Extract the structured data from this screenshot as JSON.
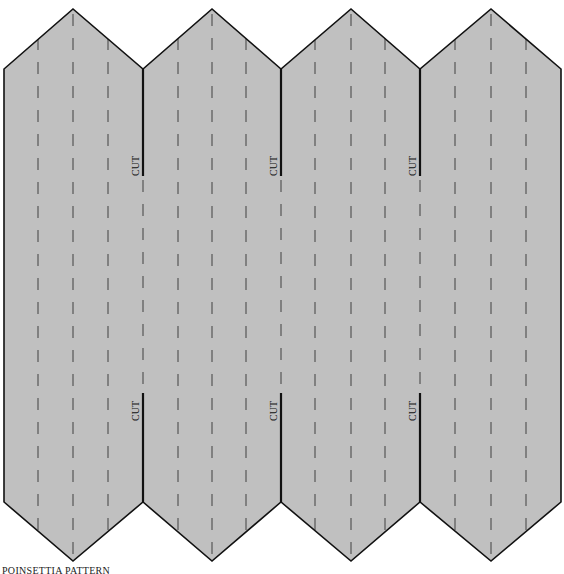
{
  "title": "POINSETTIA PATTERN",
  "colors": {
    "fill": "#c0c0c0",
    "outline": "#111111",
    "fold_line": "#555555",
    "background": "#ffffff"
  },
  "pattern": {
    "panel_count": 4,
    "panel_edges_x": [
      4,
      143,
      281,
      420,
      561
    ],
    "peak_x": [
      73,
      212,
      351,
      491
    ],
    "top_peak_y": 9,
    "top_shoulder_y": 69,
    "bottom_shoulder_y": 502,
    "bottom_peak_y": 561,
    "fold_lines_x": [
      38,
      73,
      108,
      178,
      212,
      246,
      315,
      351,
      385,
      455,
      491,
      526
    ],
    "cut_lines": [
      {
        "x": 143,
        "y1": 69,
        "y2": 176,
        "label": "CUT",
        "label_y": 158
      },
      {
        "x": 281,
        "y1": 69,
        "y2": 176,
        "label": "CUT",
        "label_y": 158
      },
      {
        "x": 420,
        "y1": 69,
        "y2": 176,
        "label": "CUT",
        "label_y": 158
      },
      {
        "x": 143,
        "y1": 393,
        "y2": 502,
        "label": "CUT",
        "label_y": 403
      },
      {
        "x": 281,
        "y1": 393,
        "y2": 502,
        "label": "CUT",
        "label_y": 403
      },
      {
        "x": 420,
        "y1": 393,
        "y2": 502,
        "label": "CUT",
        "label_y": 403
      }
    ],
    "line_styles": {
      "cut": "solid",
      "fold": "dashed"
    }
  }
}
